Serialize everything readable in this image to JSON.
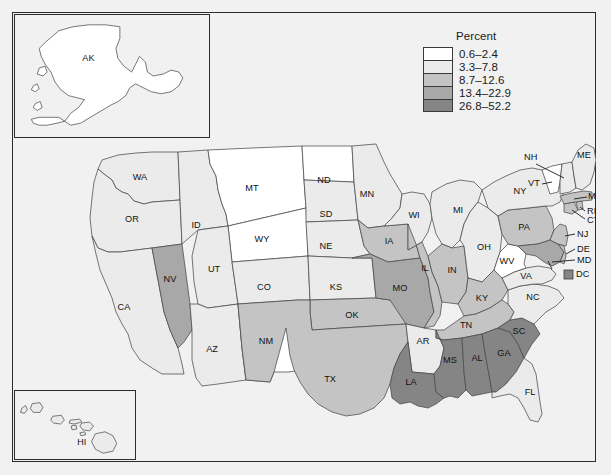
{
  "figure": {
    "background_color": "#f1f1f1",
    "frame_color": "#2b2b2b"
  },
  "legend": {
    "title": "Percent",
    "classes": [
      {
        "label": "0.6–2.4",
        "color": "#ffffff",
        "min": 0.6,
        "max": 2.4
      },
      {
        "label": "3.3–7.8",
        "color": "#ebebeb",
        "min": 3.3,
        "max": 7.8
      },
      {
        "label": "8.7–12.6",
        "color": "#c4c4c4",
        "min": 8.7,
        "max": 12.6
      },
      {
        "label": "13.4–22.9",
        "color": "#a8a8a8",
        "min": 13.4,
        "max": 22.9
      },
      {
        "label": "26.8–52.2",
        "color": "#858585",
        "min": 26.8,
        "max": 52.2
      }
    ]
  },
  "insets": {
    "alaska": {
      "label": "AK",
      "class_index": 0
    },
    "hawaii": {
      "label": "HI",
      "class_index": 1
    }
  },
  "chart_data": {
    "type": "choropleth",
    "title": "",
    "value_label": "Percent",
    "legend_classes": [
      "0.6–2.4",
      "3.3–7.8",
      "8.7–12.6",
      "13.4–22.9",
      "26.8–52.2"
    ],
    "class_colors": [
      "#ffffff",
      "#ebebeb",
      "#c4c4c4",
      "#a8a8a8",
      "#858585"
    ],
    "regions": [
      {
        "code": "AK",
        "class_index": 0
      },
      {
        "code": "HI",
        "class_index": 1
      },
      {
        "code": "WA",
        "class_index": 1
      },
      {
        "code": "OR",
        "class_index": 1
      },
      {
        "code": "CA",
        "class_index": 1
      },
      {
        "code": "NV",
        "class_index": 3
      },
      {
        "code": "ID",
        "class_index": 1
      },
      {
        "code": "MT",
        "class_index": 0
      },
      {
        "code": "WY",
        "class_index": 0
      },
      {
        "code": "UT",
        "class_index": 1
      },
      {
        "code": "AZ",
        "class_index": 1
      },
      {
        "code": "NM",
        "class_index": 0
      },
      {
        "code": "CO",
        "class_index": 1
      },
      {
        "code": "ND",
        "class_index": 0
      },
      {
        "code": "SD",
        "class_index": 1
      },
      {
        "code": "NE",
        "class_index": 1
      },
      {
        "code": "KS",
        "class_index": 1
      },
      {
        "code": "OK",
        "class_index": 2
      },
      {
        "code": "TX",
        "class_index": 2
      },
      {
        "code": "MN",
        "class_index": 1
      },
      {
        "code": "IA",
        "class_index": 2
      },
      {
        "code": "MO",
        "class_index": 3
      },
      {
        "code": "AR",
        "class_index": 1
      },
      {
        "code": "LA",
        "class_index": 4
      },
      {
        "code": "WI",
        "class_index": 1
      },
      {
        "code": "IL",
        "class_index": 2
      },
      {
        "code": "MI",
        "class_index": 1
      },
      {
        "code": "IN",
        "class_index": 2
      },
      {
        "code": "OH",
        "class_index": 1
      },
      {
        "code": "KY",
        "class_index": 2
      },
      {
        "code": "TN",
        "class_index": 2
      },
      {
        "code": "MS",
        "class_index": 4
      },
      {
        "code": "AL",
        "class_index": 4
      },
      {
        "code": "GA",
        "class_index": 4
      },
      {
        "code": "FL",
        "class_index": 1
      },
      {
        "code": "SC",
        "class_index": 4
      },
      {
        "code": "NC",
        "class_index": 1
      },
      {
        "code": "VA",
        "class_index": 1
      },
      {
        "code": "WV",
        "class_index": 0
      },
      {
        "code": "MD",
        "class_index": 3
      },
      {
        "code": "DE",
        "class_index": 2
      },
      {
        "code": "DC",
        "class_index": 4
      },
      {
        "code": "PA",
        "class_index": 2
      },
      {
        "code": "NJ",
        "class_index": 2
      },
      {
        "code": "NY",
        "class_index": 1
      },
      {
        "code": "CT",
        "class_index": 2
      },
      {
        "code": "RI",
        "class_index": 2
      },
      {
        "code": "MA",
        "class_index": 2
      },
      {
        "code": "VT",
        "class_index": 0
      },
      {
        "code": "NH",
        "class_index": 1
      },
      {
        "code": "ME",
        "class_index": 1
      }
    ]
  },
  "state_labels": {
    "WA": "WA",
    "OR": "OR",
    "CA": "CA",
    "NV": "NV",
    "ID": "ID",
    "MT": "MT",
    "WY": "WY",
    "UT": "UT",
    "AZ": "AZ",
    "NM": "NM",
    "CO": "CO",
    "ND": "ND",
    "SD": "SD",
    "NE": "NE",
    "KS": "KS",
    "OK": "OK",
    "TX": "TX",
    "MN": "MN",
    "IA": "IA",
    "MO": "MO",
    "AR": "AR",
    "LA": "LA",
    "WI": "WI",
    "IL": "IL",
    "MI": "MI",
    "IN": "IN",
    "OH": "OH",
    "KY": "KY",
    "TN": "TN",
    "MS": "MS",
    "AL": "AL",
    "GA": "GA",
    "FL": "FL",
    "SC": "SC",
    "NC": "NC",
    "VA": "VA",
    "WV": "WV",
    "MD": "MD",
    "DE": "DE",
    "DC": "DC",
    "PA": "PA",
    "NJ": "NJ",
    "NY": "NY",
    "CT": "CT",
    "RI": "RI",
    "MA": "MA",
    "VT": "VT",
    "NH": "NH",
    "ME": "ME",
    "AK": "AK",
    "HI": "HI"
  }
}
